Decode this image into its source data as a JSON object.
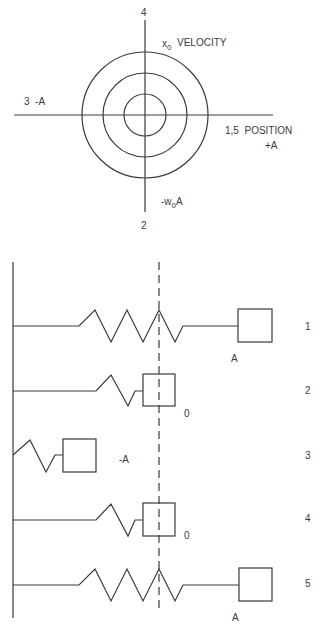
{
  "phase_diagram": {
    "label_top": "4",
    "label_bottom": "2",
    "label_left": "3  -A",
    "label_velocity_sub": "x",
    "label_velocity_subscript": "0",
    "label_velocity": "VELOCITY",
    "label_position": "1,5  POSITION",
    "label_plus_a": "+A",
    "label_minus_w_prefix": "-w",
    "label_minus_w_sub": "0",
    "label_minus_w_suffix": "A",
    "circles_radii": [
      21,
      42,
      63
    ]
  },
  "spring_states": [
    {
      "index": "1",
      "mass_label": "A"
    },
    {
      "index": "2",
      "mass_label": "0"
    },
    {
      "index": "3",
      "mass_label": "-A"
    },
    {
      "index": "4",
      "mass_label": "0"
    },
    {
      "index": "5",
      "mass_label": "A"
    }
  ],
  "colors": {
    "line": "#3a3a3a",
    "background": "#ffffff"
  }
}
